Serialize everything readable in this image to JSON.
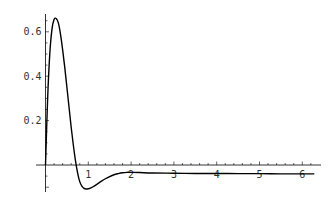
{
  "chart_data": {
    "type": "line",
    "title": "",
    "xlabel": "",
    "ylabel": "",
    "xlim": [
      0,
      6.3
    ],
    "ylim": [
      -0.12,
      0.68
    ],
    "grid": false,
    "legend": null,
    "x_ticks": [
      "1",
      "2",
      "3",
      "4",
      "5",
      "6"
    ],
    "y_ticks": [
      "0.2",
      "0.4",
      "0.6"
    ],
    "series": [
      {
        "name": "f(t)",
        "color": "#000000",
        "x": [
          0,
          0.05,
          0.1,
          0.15,
          0.2,
          0.25,
          0.3,
          0.35,
          0.4,
          0.45,
          0.5,
          0.55,
          0.6,
          0.65,
          0.7,
          0.75,
          0.8,
          0.85,
          0.9,
          0.95,
          1.0,
          1.05,
          1.1,
          1.2,
          1.3,
          1.4,
          1.5,
          1.6,
          1.7,
          1.8,
          1.9,
          2.0,
          2.2,
          2.5,
          3.0,
          3.5,
          4.0,
          4.5,
          5.0,
          5.5,
          6.0,
          6.28
        ],
        "values": [
          0,
          0.3,
          0.5,
          0.61,
          0.655,
          0.66,
          0.64,
          0.59,
          0.52,
          0.44,
          0.35,
          0.26,
          0.17,
          0.09,
          0.02,
          -0.035,
          -0.075,
          -0.095,
          -0.105,
          -0.108,
          -0.107,
          -0.104,
          -0.099,
          -0.087,
          -0.074,
          -0.062,
          -0.052,
          -0.044,
          -0.039,
          -0.035,
          -0.033,
          -0.033,
          -0.034,
          -0.036,
          -0.037,
          -0.038,
          -0.038,
          -0.039,
          -0.039,
          -0.04,
          -0.04,
          -0.04
        ]
      }
    ]
  },
  "colors": {
    "axis": "#000000",
    "curve": "#000000",
    "labels": "#333333"
  }
}
